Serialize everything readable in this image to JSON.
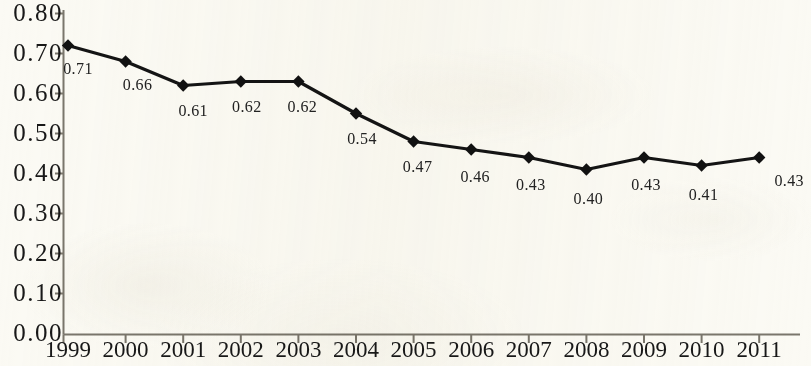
{
  "chart_data": {
    "type": "line",
    "title": "",
    "subtitle": "",
    "xlabel": "",
    "ylabel": "",
    "categories": [
      "1999",
      "2000",
      "2001",
      "2002",
      "2003",
      "2004",
      "2005",
      "2006",
      "2007",
      "2008",
      "2009",
      "2010",
      "2011"
    ],
    "values": [
      0.72,
      0.68,
      0.62,
      0.63,
      0.63,
      0.55,
      0.48,
      0.46,
      0.44,
      0.41,
      0.44,
      0.42,
      0.44
    ],
    "data_labels": [
      "0.71",
      "0.66",
      "0.61",
      "0.62",
      "0.62",
      "0.54",
      "0.47",
      "0.46",
      "0.43",
      "0.40",
      "0.43",
      "0.41",
      "0.43"
    ],
    "ylim": [
      0.0,
      0.8
    ],
    "ytick_labels": [
      "0.80",
      "0.70",
      "0.60",
      "0.50",
      "0.40",
      "0.30",
      "0.20",
      "0.10",
      "0.00"
    ],
    "ytick_values": [
      0.8,
      0.7,
      0.6,
      0.5,
      0.4,
      0.3,
      0.2,
      0.1,
      0.0
    ],
    "grid": false,
    "legend": "none",
    "marker": "diamond",
    "series_color": "#111111",
    "background_color": "#fbfaf4",
    "axis_color": "#6e6a60"
  }
}
